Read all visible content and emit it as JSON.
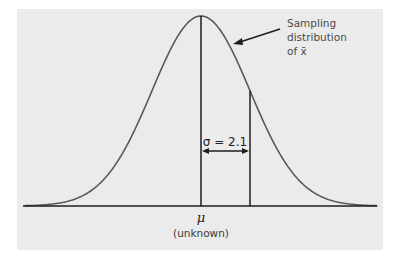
{
  "diagram": {
    "annotation": {
      "lines": [
        "Sampling",
        "distribution",
        "of x̄"
      ]
    },
    "sigma_label": "σ = 2.1",
    "mean_symbol": "μ",
    "mean_note": "(unknown)",
    "colors": {
      "panel": "#ebebeb",
      "curve": "#5a5a5a",
      "lines": "#1e1e1e"
    }
  },
  "chart_data": {
    "type": "line",
    "title": "",
    "xlabel": "",
    "ylabel": "",
    "distribution": "normal",
    "mean_label": "μ (unknown)",
    "sigma": 2.1,
    "marked_points_in_sd": [
      0,
      1
    ],
    "x_range_in_sd": [
      -3.6,
      3.6
    ]
  }
}
